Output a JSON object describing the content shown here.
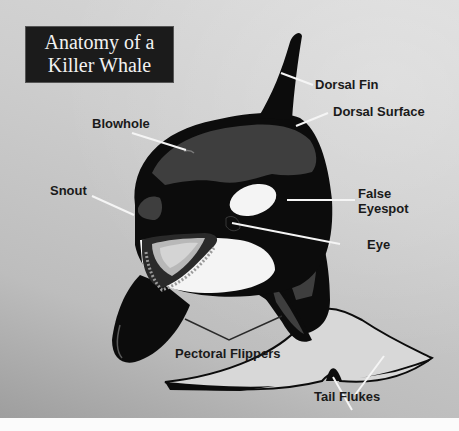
{
  "title": {
    "line1": "Anatomy of a",
    "line2": "Killer Whale"
  },
  "labels": {
    "dorsal_fin": "Dorsal Fin",
    "dorsal_surface": "Dorsal Surface",
    "blowhole": "Blowhole",
    "snout": "Snout",
    "false_eyespot_line1": "False",
    "false_eyespot_line2": "Eyespot",
    "eye": "Eye",
    "pectoral_flippers": "Pectoral Flippers",
    "tail_flukes": "Tail Flukes"
  },
  "colors": {
    "whale_black": "#0c0c0c",
    "saddle_gray": "#3e3e3e",
    "white_patch": "#f4f4f4",
    "leader_line_light": "#f5f5f5",
    "leader_line_dark": "#2a2a2a",
    "title_bg": "#1b1b1b"
  }
}
